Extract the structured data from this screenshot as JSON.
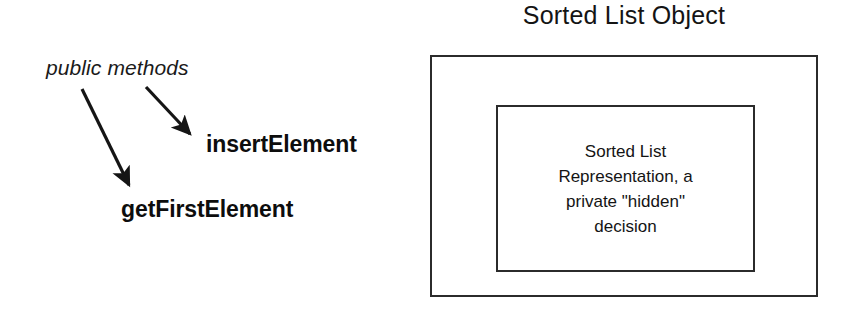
{
  "diagram": {
    "left_panel": {
      "annotation_label": "public methods",
      "methods": [
        {
          "name": "insertElement"
        },
        {
          "name": "getFirstElement"
        }
      ],
      "arrows": [
        {
          "name": "arrow-to-get-first-element",
          "x1": 82,
          "y1": 89,
          "x2": 131,
          "y2": 188
        },
        {
          "name": "arrow-to-insert-element",
          "x1": 146,
          "y1": 87,
          "x2": 193,
          "y2": 138
        }
      ]
    },
    "right_panel": {
      "title": "Sorted List Object",
      "representation_text": "Sorted List\nRepresentation, a\nprivate \"hidden\"\ndecision"
    }
  },
  "colors": {
    "ink": "#141414",
    "stroke": "#2b2b2b",
    "background": "#ffffff"
  }
}
